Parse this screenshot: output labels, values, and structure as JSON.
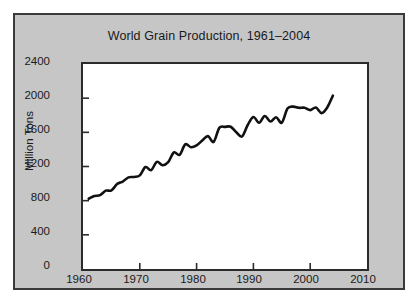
{
  "chart_data": {
    "type": "line",
    "title": "World Grain Production, 1961–2004",
    "xlabel": "",
    "ylabel": "Million Tons",
    "xlim": [
      1960,
      2010
    ],
    "ylim": [
      0,
      2400
    ],
    "xticks": [
      1960,
      1970,
      1980,
      1990,
      2000,
      2010
    ],
    "yticks": [
      0,
      400,
      800,
      1200,
      1600,
      2000,
      2400
    ],
    "grid": false,
    "legend": null,
    "series": [
      {
        "name": "World grain production",
        "color": "#111111",
        "x": [
          1961,
          1962,
          1963,
          1964,
          1965,
          1966,
          1967,
          1968,
          1969,
          1970,
          1971,
          1972,
          1973,
          1974,
          1975,
          1976,
          1977,
          1978,
          1979,
          1980,
          1981,
          1982,
          1983,
          1984,
          1985,
          1986,
          1987,
          1988,
          1989,
          1990,
          1991,
          1992,
          1993,
          1994,
          1995,
          1996,
          1997,
          1998,
          1999,
          2000,
          2001,
          2002,
          2003,
          2004
        ],
        "values": [
          822,
          854,
          864,
          917,
          920,
          994,
          1024,
          1073,
          1078,
          1096,
          1194,
          1158,
          1254,
          1215,
          1250,
          1365,
          1336,
          1459,
          1426,
          1447,
          1504,
          1556,
          1488,
          1652,
          1664,
          1665,
          1600,
          1551,
          1686,
          1780,
          1712,
          1791,
          1726,
          1776,
          1714,
          1878,
          1901,
          1887,
          1888,
          1860,
          1890,
          1825,
          1891,
          2030
        ]
      }
    ]
  },
  "figure": {
    "title": "World Grain Production, 1961–2004",
    "y_axis_title": "Million Tons",
    "y_tick_labels": [
      "2400",
      "2000",
      "1600",
      "1200",
      "800",
      "400",
      "0"
    ],
    "x_tick_labels": [
      "1960",
      "1970",
      "1980",
      "1990",
      "2000",
      "2010"
    ],
    "panel_color": "#c6c6c6",
    "plot_color": "#ffffff",
    "line_color": "#111111",
    "frame_color": "#3a3a3a"
  }
}
